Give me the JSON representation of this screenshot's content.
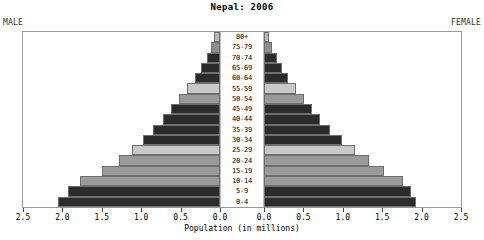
{
  "chart_data": {
    "type": "bar",
    "subtype": "population-pyramid",
    "title": "Nepal: 2006",
    "xlabel": "Population (in millions)",
    "ylabel": "",
    "left_label": "MALE",
    "right_label": "FEMALE",
    "categories": [
      "80+",
      "75-79",
      "70-74",
      "65-69",
      "60-64",
      "55-59",
      "50-54",
      "45-49",
      "40-44",
      "35-39",
      "30-34",
      "25-29",
      "20-24",
      "15-19",
      "10-14",
      "5-9",
      "0-4"
    ],
    "tick_values": [
      2.5,
      2.0,
      1.5,
      1.0,
      0.5,
      0.0
    ],
    "tick_labels_left": [
      "2.5",
      "2.0",
      "1.5",
      "1.0",
      "0.5",
      "0.0"
    ],
    "tick_labels_right": [
      "0.0",
      "0.5",
      "1.0",
      "1.5",
      "2.0",
      "2.5"
    ],
    "xlim": [
      0,
      2.5
    ],
    "grid": false,
    "legend": "none",
    "series": [
      {
        "name": "MALE",
        "side": "left",
        "values": [
          0.07,
          0.11,
          0.17,
          0.24,
          0.32,
          0.42,
          0.52,
          0.62,
          0.72,
          0.85,
          0.98,
          1.12,
          1.28,
          1.5,
          1.78,
          1.93,
          2.05
        ]
      },
      {
        "name": "FEMALE",
        "side": "right",
        "values": [
          0.06,
          0.1,
          0.16,
          0.23,
          0.31,
          0.41,
          0.51,
          0.61,
          0.71,
          0.84,
          0.99,
          1.16,
          1.33,
          1.52,
          1.76,
          1.87,
          1.93
        ]
      }
    ],
    "bar_colors": [
      "#b9b9b9",
      "#8f8f8f",
      "#2b2b2b",
      "#2b2b2b",
      "#2b2b2b",
      "#c8c8c8",
      "#9a9a9a",
      "#2b2b2b",
      "#2b2b2b",
      "#2b2b2b",
      "#2b2b2b",
      "#c8c8c8",
      "#9a9a9a",
      "#9a9a9a",
      "#9a9a9a",
      "#2b2b2b",
      "#2b2b2b"
    ]
  },
  "colors": {
    "frame": "#9a9a9a",
    "text": "#000000",
    "background": "#ffffff"
  }
}
